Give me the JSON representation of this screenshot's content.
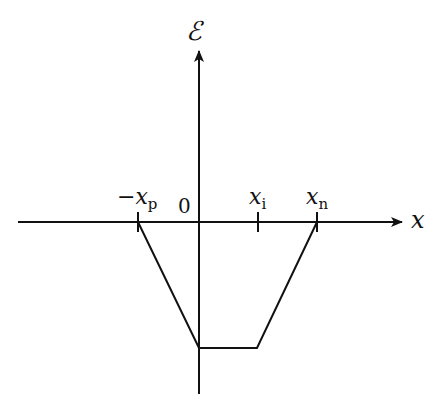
{
  "diagram": {
    "type": "energy-band-profile",
    "axes": {
      "x_label": "x",
      "y_label": "ℰ",
      "origin_label": "0"
    },
    "ticks": [
      {
        "id": "neg_xp",
        "sign": "−",
        "base": "x",
        "subscript": "p"
      },
      {
        "id": "xi",
        "sign": "",
        "base": "x",
        "subscript": "i"
      },
      {
        "id": "xn",
        "sign": "",
        "base": "x",
        "subscript": "n"
      }
    ],
    "profile": {
      "description": "Field ℰ(x) is zero outside [−xp, xn]; decreases linearly from 0 at −xp to a minimum at x=0, stays constant from 0 to xi, then rises linearly back to 0 at xn.",
      "points": [
        {
          "x": "-xp",
          "E": 0
        },
        {
          "x": "0",
          "E": "min"
        },
        {
          "x": "xi",
          "E": "min"
        },
        {
          "x": "xn",
          "E": 0
        }
      ]
    },
    "colors": {
      "stroke": "#111111",
      "background": "#ffffff"
    }
  }
}
